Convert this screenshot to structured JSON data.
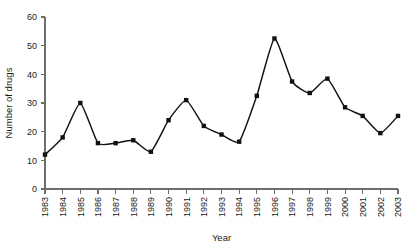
{
  "chart_data": {
    "type": "line",
    "title": "",
    "xlabel": "Year",
    "ylabel": "Number of drugs",
    "categories": [
      "1983",
      "1984",
      "1985",
      "1986",
      "1987",
      "1988",
      "1989",
      "1990",
      "1991",
      "1992",
      "1993",
      "1994",
      "1995",
      "1996",
      "1997",
      "1998",
      "1999",
      "2000",
      "2001",
      "2002",
      "2003"
    ],
    "values": [
      12,
      18,
      30,
      16,
      16,
      17,
      13,
      24,
      31,
      22,
      19,
      16.5,
      32.5,
      52.5,
      37.5,
      33.5,
      38.5,
      28.5,
      25.5,
      19.5,
      25.5
    ],
    "series": [
      {
        "name": "Number of drugs",
        "values": [
          12,
          18,
          30,
          16,
          16,
          17,
          13,
          24,
          31,
          22,
          19,
          16.5,
          32.5,
          52.5,
          37.5,
          33.5,
          38.5,
          28.5,
          25.5,
          19.5,
          25.5
        ]
      }
    ],
    "x": [
      1983,
      1984,
      1985,
      1986,
      1987,
      1988,
      1989,
      1990,
      1991,
      1992,
      1993,
      1994,
      1995,
      1996,
      1997,
      1998,
      1999,
      2000,
      2001,
      2002,
      2003
    ],
    "xlim": [
      1983,
      2003
    ],
    "ylim": [
      0,
      60
    ],
    "yticks": [
      0,
      10,
      20,
      30,
      40,
      50,
      60
    ],
    "ytick_labels": [
      "0",
      "10",
      "20",
      "30",
      "40",
      "50",
      "60"
    ],
    "xticks": [
      1983,
      1984,
      1985,
      1986,
      1987,
      1988,
      1989,
      1990,
      1991,
      1992,
      1993,
      1994,
      1995,
      1996,
      1997,
      1998,
      1999,
      2000,
      2001,
      2002,
      2003
    ],
    "xtick_labels": [
      "1983",
      "1984",
      "1985",
      "1986",
      "1987",
      "1988",
      "1989",
      "1990",
      "1991",
      "1992",
      "1993",
      "1994",
      "1995",
      "1996",
      "1997",
      "1998",
      "1999",
      "2000",
      "2001",
      "2002",
      "2003"
    ],
    "xtick_rotation": 90,
    "grid": false,
    "legend": false,
    "legend_position": "none",
    "marker": "square",
    "line_color": "#111111",
    "marker_color": "#111111",
    "axis_color": "#6e6e6e",
    "background_color": "#ffffff"
  },
  "axes": {
    "y_title": "Number of drugs",
    "x_title": "Year"
  }
}
